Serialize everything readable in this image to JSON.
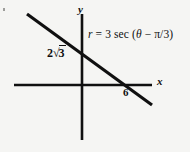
{
  "figure": {
    "background_color": "#f5f5f3",
    "ink_color": "#101010",
    "width": 190,
    "height": 152
  },
  "axes": {
    "x_label": "x",
    "y_label": "y",
    "x_axis": {
      "y": 85,
      "x_start": 14,
      "x_end": 152
    },
    "y_axis": {
      "x": 82,
      "y_start": 14,
      "y_end": 140
    }
  },
  "annotations": {
    "y_intercept": {
      "coefficient": "2",
      "radical": "√",
      "radicand": "3",
      "text": "2√3"
    },
    "x_intercept": {
      "text": "6"
    },
    "equation": {
      "lhs": "r",
      "equals": "=",
      "coefficient": "3",
      "function": "sec",
      "open_paren": "(",
      "theta": "θ",
      "minus": "−",
      "pi": "π",
      "slash": "/",
      "denominator": "3",
      "close_paren": ")",
      "text": "r = 3 sec (θ − π/3)"
    }
  },
  "chart_data": {
    "type": "line",
    "title": "",
    "subtitle": "",
    "xlabel": "x",
    "ylabel": "y",
    "grid": false,
    "legend": null,
    "equation_label": "r = 3 sec (θ − π/3)",
    "cartesian_equation": "x + √3 y = 6",
    "series": [
      {
        "name": "r = 3 sec (θ − π/3)",
        "kind": "line",
        "slope": -0.5773502692,
        "intercept_y": 3.4641016151,
        "points": [
          {
            "x": -3.0,
            "y": 5.196
          },
          {
            "x": 0.0,
            "y": 3.464
          },
          {
            "x": 6.0,
            "y": 0.0
          },
          {
            "x": 9.0,
            "y": -1.732
          }
        ]
      }
    ],
    "annotated_points": [
      {
        "label": "2√3",
        "x": 0,
        "y": 3.4641016151,
        "axis": "y",
        "value": 3.4641016151
      },
      {
        "label": "6",
        "x": 6,
        "y": 0,
        "axis": "x",
        "value": 6
      }
    ],
    "tick_labels": {
      "x": [
        "6"
      ],
      "y": [
        "2√3"
      ]
    },
    "xlim": [
      -4.7,
      10.8
    ],
    "ylim": [
      -6.2,
      4.9
    ],
    "pixel_geometry": {
      "origin": {
        "x": 82,
        "y": 85
      },
      "line_start": {
        "x": 27,
        "y": 14
      },
      "line_end": {
        "x": 152,
        "y": 105
      },
      "y_axis_crossing": {
        "x": 82,
        "y": 53
      },
      "x_axis_crossing": {
        "x": 128,
        "y": 85
      }
    }
  }
}
